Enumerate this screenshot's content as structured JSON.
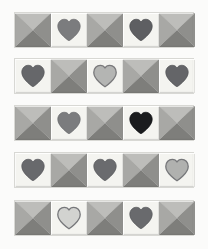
{
  "scene": {
    "description": "Five decorative ceramic border strips, each composed of five square tiles alternating four-facet pyramid studs and heart-motif tiles",
    "background_color": "#fbfbfa",
    "strip_count": 5,
    "tiles_per_strip": 5
  },
  "palette": {
    "background": "#fbfbfa",
    "strip_border": "#d8d8d4",
    "heart_tile_bg": "#f4f4f0",
    "pyramid_facet_top": "#bdbdba",
    "pyramid_facet_left": "#a8a8a5",
    "pyramid_facet_right": "#8f8f8c",
    "pyramid_facet_bottom": "#7e7e7b",
    "heart_medium": "#77787a",
    "heart_dark": "#5f6063",
    "heart_black": "#191a1c",
    "heart_light": "#b2b3b1",
    "heart_outline": "#6d6e70"
  },
  "geometry": {
    "strip_left": 14,
    "strip_width": 180,
    "tile_size": 36,
    "strip_tops": [
      12,
      58,
      105,
      152,
      200
    ]
  },
  "strips": [
    {
      "name": "strip-1",
      "top": 12,
      "tiles": [
        {
          "type": "pyramid",
          "label": "pyramid-stud"
        },
        {
          "type": "heart",
          "label": "heart-medium",
          "fill": "#7b7c7e",
          "outline": "#6d6e70",
          "outlined": false
        },
        {
          "type": "pyramid",
          "label": "pyramid-stud"
        },
        {
          "type": "heart",
          "label": "heart-dark",
          "fill": "#5e5f62",
          "outline": "#4c4d50",
          "outlined": false
        },
        {
          "type": "pyramid",
          "label": "pyramid-stud"
        }
      ]
    },
    {
      "name": "strip-2",
      "top": 58,
      "tiles": [
        {
          "type": "heart",
          "label": "heart-dark",
          "fill": "#66676a",
          "outline": "#545558",
          "outlined": false
        },
        {
          "type": "pyramid",
          "label": "pyramid-stud"
        },
        {
          "type": "heart",
          "label": "heart-light-outlined",
          "fill": "#b4b5b3",
          "outline": "#79797b",
          "outlined": true
        },
        {
          "type": "pyramid",
          "label": "pyramid-stud"
        },
        {
          "type": "heart",
          "label": "heart-dark",
          "fill": "#646568",
          "outline": "#525356",
          "outlined": false
        }
      ]
    },
    {
      "name": "strip-3",
      "top": 105,
      "tiles": [
        {
          "type": "pyramid",
          "label": "pyramid-stud"
        },
        {
          "type": "heart",
          "label": "heart-medium",
          "fill": "#7b7c7e",
          "outline": "#6a6b6d",
          "outlined": false
        },
        {
          "type": "pyramid",
          "label": "pyramid-stud"
        },
        {
          "type": "heart",
          "label": "heart-black",
          "fill": "#1b1c1e",
          "outline": "#111214",
          "outlined": false
        },
        {
          "type": "pyramid",
          "label": "pyramid-stud"
        }
      ]
    },
    {
      "name": "strip-4",
      "top": 152,
      "tiles": [
        {
          "type": "heart",
          "label": "heart-dark",
          "fill": "#68696c",
          "outline": "#56575a",
          "outlined": false
        },
        {
          "type": "pyramid",
          "label": "pyramid-stud"
        },
        {
          "type": "heart",
          "label": "heart-dark",
          "fill": "#6a6b6e",
          "outline": "#58595c",
          "outlined": false
        },
        {
          "type": "pyramid",
          "label": "pyramid-stud"
        },
        {
          "type": "heart",
          "label": "heart-light-outlined",
          "fill": "#b0b1af",
          "outline": "#76777a",
          "outlined": true
        }
      ]
    },
    {
      "name": "strip-5",
      "top": 200,
      "tiles": [
        {
          "type": "pyramid",
          "label": "pyramid-stud"
        },
        {
          "type": "heart",
          "label": "heart-light-outlined",
          "fill": "#d2d3d0",
          "outline": "#76777a",
          "outlined": true
        },
        {
          "type": "pyramid",
          "label": "pyramid-stud"
        },
        {
          "type": "heart",
          "label": "heart-dark",
          "fill": "#696a6d",
          "outline": "#57585b",
          "outlined": false
        },
        {
          "type": "pyramid",
          "label": "pyramid-stud"
        }
      ]
    }
  ]
}
